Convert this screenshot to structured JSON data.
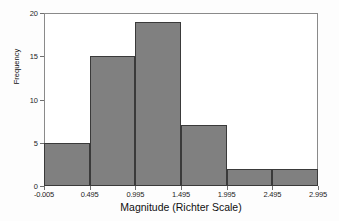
{
  "chart_data": {
    "type": "bar",
    "chart_subtype": "histogram",
    "title": "",
    "xlabel": "Magnitude (Richter Scale)",
    "ylabel": "Frequency",
    "categories": [
      "-0.005-0.495",
      "0.495-0.995",
      "0.995-1.495",
      "1.495-1.995",
      "1.995-2.495",
      "2.495-2.995"
    ],
    "bin_edges": [
      -0.005,
      0.495,
      0.995,
      1.495,
      1.995,
      2.495,
      2.995
    ],
    "values": [
      5,
      15,
      19,
      7,
      2,
      2
    ],
    "bin_width": 0.5,
    "xlim": [
      -0.005,
      2.995
    ],
    "ylim": [
      0,
      20
    ],
    "xticks": [
      "-0.005",
      "0.495",
      "0.995",
      "1.495",
      "1.995",
      "2.495",
      "2.995"
    ],
    "xtick_values": [
      -0.005,
      0.495,
      0.995,
      1.495,
      1.995,
      2.495,
      2.995
    ],
    "yticks": [
      "0",
      "5",
      "10",
      "15",
      "20"
    ],
    "ytick_values": [
      0,
      5,
      10,
      15,
      20
    ],
    "grid": false,
    "legend": null,
    "bar_color": "#808080",
    "bar_edge_color": "#3a3a3a",
    "plot_background": "#ffffff",
    "frame_color": "#8a8a8a"
  }
}
